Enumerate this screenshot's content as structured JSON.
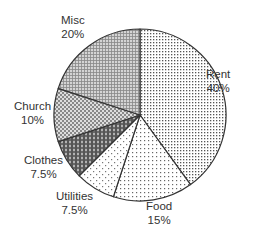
{
  "chart_data": {
    "type": "pie",
    "title": "",
    "start_angle": "12 o'clock",
    "direction": "clockwise",
    "categories": [
      "Rent",
      "Food",
      "Utilities",
      "Clothes",
      "Church",
      "Misc"
    ],
    "values": [
      40,
      15,
      7.5,
      7.5,
      10,
      20
    ],
    "value_labels": [
      "40%",
      "15%",
      "7.5%",
      "7.5%",
      "10%",
      "20%"
    ],
    "legend": "none (labels placed outside slices)",
    "slices": [
      {
        "name": "Rent",
        "value": 40,
        "label": "40%",
        "pattern": "dots-medium"
      },
      {
        "name": "Food",
        "value": 15,
        "label": "15%",
        "pattern": "dots-sparse"
      },
      {
        "name": "Utilities",
        "value": 7.5,
        "label": "7.5%",
        "pattern": "dots-very-sparse"
      },
      {
        "name": "Clothes",
        "value": 7.5,
        "label": "7.5%",
        "pattern": "dark-checker"
      },
      {
        "name": "Church",
        "value": 10,
        "label": "10%",
        "pattern": "medium-checker"
      },
      {
        "name": "Misc",
        "value": 20,
        "label": "20%",
        "pattern": "fine-grid"
      }
    ]
  },
  "colors": {
    "outline": "#333333",
    "text": "#333333",
    "background": "#ffffff"
  }
}
